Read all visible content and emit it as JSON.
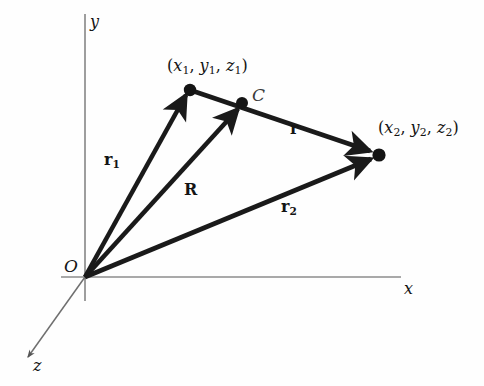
{
  "figure": {
    "kind": "vector-diagram",
    "background_color": "#fefefe",
    "axis_color": "#8a8a8a",
    "vector_color": "#1a1a1a",
    "axes": [
      {
        "name": "y",
        "label": "y"
      },
      {
        "name": "x",
        "label": "x"
      },
      {
        "name": "z",
        "label": "z"
      }
    ],
    "origin_label": "O",
    "points": [
      {
        "name": "point-1",
        "label": "(x1, y1, z1)"
      },
      {
        "name": "point-c",
        "label": "C"
      },
      {
        "name": "point-2",
        "label": "(x2, y2, z2)"
      }
    ],
    "vectors": [
      {
        "name": "r1",
        "label": "r1",
        "from": "O",
        "to": "point-1"
      },
      {
        "name": "R",
        "label": "R",
        "from": "O",
        "to": "point-c"
      },
      {
        "name": "r2",
        "label": "r2",
        "from": "O",
        "to": "point-2"
      },
      {
        "name": "r",
        "label": "r",
        "from": "point-1",
        "to": "point-2"
      }
    ],
    "labels": {
      "axis_y": "y",
      "axis_x": "x",
      "axis_z": "z",
      "origin": "O",
      "point_c": "C",
      "point1_open": "(",
      "point1_x": "x",
      "point1_x_sub": "1",
      "point1_comma1": ",",
      "point1_y": "y",
      "point1_y_sub": "1",
      "point1_comma2": ",",
      "point1_z": "z",
      "point1_z_sub": "1",
      "point1_close": ")",
      "point2_open": "(",
      "point2_x": "x",
      "point2_x_sub": "2",
      "point2_comma1": ",",
      "point2_y": "y",
      "point2_y_sub": "2",
      "point2_comma2": ",",
      "point2_z": "z",
      "point2_z_sub": "2",
      "point2_close": ")",
      "vec_r1": "r",
      "vec_r1_sub": "1",
      "vec_R": "R",
      "vec_r2": "r",
      "vec_r2_sub": "2",
      "vec_r": "r"
    }
  }
}
